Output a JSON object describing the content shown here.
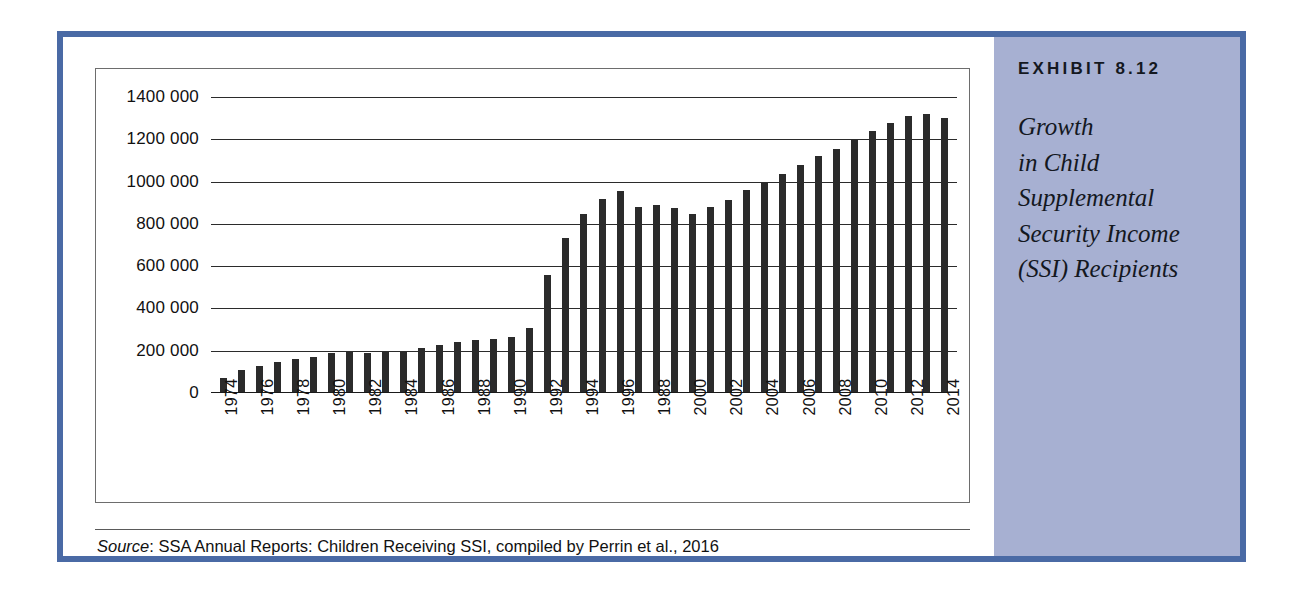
{
  "exhibit": {
    "number_label": "EXHIBIT 8.12",
    "title_lines": [
      "Growth",
      "in Child",
      "Supplemental",
      "Security Income",
      "(SSI) Recipients"
    ],
    "sidebar_color": "#a7b0d2",
    "border_color": "#4a6aa5"
  },
  "source": {
    "label": "Source",
    "text": ": SSA Annual Reports: Children Receiving SSI, compiled by Perrin et al., 2016"
  },
  "chart_data": {
    "type": "bar",
    "xlabel": "",
    "ylabel": "",
    "ylim": [
      0,
      1400000
    ],
    "grid": true,
    "legend": false,
    "bar_color": "#2b2b2b",
    "ytick_labels": [
      "1400 000",
      "1200 000",
      "1000 000",
      "800 000",
      "600 000",
      "400 000",
      "200 000",
      "0"
    ],
    "ytick_values": [
      1400000,
      1200000,
      1000000,
      800000,
      600000,
      400000,
      200000,
      0
    ],
    "xtick_labels": [
      "1974",
      "",
      "1976",
      "",
      "1978",
      "",
      "1980",
      "",
      "1982",
      "",
      "1984",
      "",
      "1986",
      "",
      "1988",
      "",
      "1990",
      "",
      "1992",
      "",
      "1994",
      "",
      "1996",
      "",
      "1988",
      "",
      "2000",
      "",
      "2002",
      "",
      "2004",
      "",
      "2006",
      "",
      "2008",
      "",
      "2010",
      "",
      "2012",
      "",
      "2014"
    ],
    "categories": [
      1974,
      1975,
      1976,
      1977,
      1978,
      1979,
      1980,
      1981,
      1982,
      1983,
      1984,
      1985,
      1986,
      1987,
      1988,
      1989,
      1990,
      1991,
      1992,
      1993,
      1994,
      1995,
      1996,
      1997,
      1998,
      1999,
      2000,
      2001,
      2002,
      2003,
      2004,
      2005,
      2006,
      2007,
      2008,
      2009,
      2010,
      2011,
      2012,
      2013,
      2014
    ],
    "values": [
      71000,
      107000,
      128000,
      148000,
      163000,
      172000,
      190000,
      195000,
      191000,
      196000,
      200000,
      212000,
      227000,
      241000,
      252000,
      255000,
      264000,
      309000,
      557000,
      735000,
      846000,
      917000,
      955000,
      880000,
      887000,
      877000,
      847000,
      882000,
      915000,
      959000,
      1000000,
      1036000,
      1078000,
      1121000,
      1154000,
      1199000,
      1239000,
      1277000,
      1312000,
      1322000,
      1302000
    ]
  }
}
